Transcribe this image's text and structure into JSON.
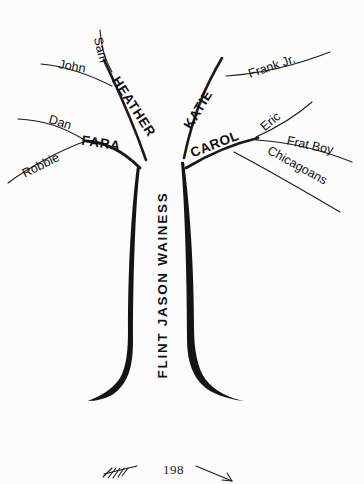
{
  "page": {
    "background_color": "#fcfcfc",
    "ink_color": "#141414",
    "width": 364,
    "height": 484
  },
  "tree": {
    "trunk": {
      "label": "FLINT JASON WAINESS",
      "orientation": "vertical-bottom-to-top"
    },
    "left_side": {
      "major_branches": [
        {
          "label": "HEATHER",
          "children": [
            "Sam",
            "John"
          ]
        },
        {
          "label": "FARA",
          "children": [
            "Dan",
            "Robbie"
          ]
        }
      ]
    },
    "right_side": {
      "major_branches": [
        {
          "label": "KATIE",
          "children": [
            "Frank Jr."
          ]
        },
        {
          "label": "CAROL",
          "children": [
            "Eric",
            "Frat Boy",
            "Chicagoans"
          ]
        }
      ]
    },
    "all_labels": [
      "Sam",
      "John",
      "HEATHER",
      "Dan",
      "FARA",
      "Robbie",
      "KATIE",
      "Frank Jr.",
      "Eric",
      "CAROL",
      "Frat Boy",
      "Chicagoans",
      "FLINT JASON WAINESS"
    ]
  },
  "footer": {
    "page_number": "198",
    "left_ornament": "fletched-arrow-left-icon",
    "right_ornament": "arrow-right-icon"
  }
}
